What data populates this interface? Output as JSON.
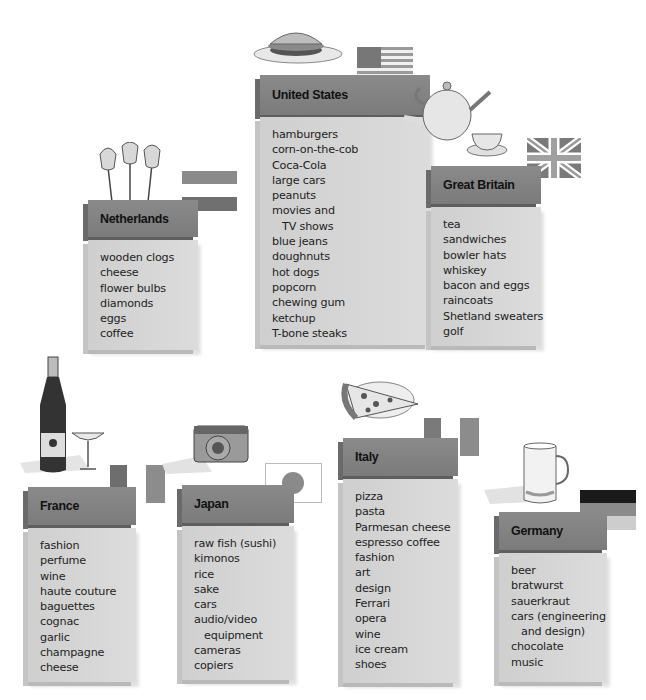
{
  "countries": [
    {
      "name": "United States",
      "items": [
        "hamburgers",
        "corn-on-the-cob",
        "Coca-Cola",
        "large cars",
        "peanuts",
        "movies and",
        "   TV shows",
        "blue jeans",
        "doughnuts",
        "hot dogs",
        "popcorn",
        "chewing gum",
        "ketchup",
        "T-bone steaks"
      ],
      "flag": "usa-flag",
      "illustration": "hamburger"
    },
    {
      "name": "Netherlands",
      "items": [
        "wooden clogs",
        "cheese",
        "flower bulbs",
        "diamonds",
        "eggs",
        "coffee"
      ],
      "flag": "netherlands-flag",
      "illustration": "tulips"
    },
    {
      "name": "Great Britain",
      "items": [
        "tea",
        "sandwiches",
        "bowler hats",
        "whiskey",
        "bacon and eggs",
        "raincoats",
        "Shetland sweaters",
        "golf"
      ],
      "flag": "union-jack-flag",
      "illustration": "teapot"
    },
    {
      "name": "France",
      "items": [
        "fashion",
        "perfume",
        "wine",
        "haute couture",
        "baguettes",
        "cognac",
        "garlic",
        "champagne",
        "cheese"
      ],
      "flag": "france-flag",
      "illustration": "champagne"
    },
    {
      "name": "Japan",
      "items": [
        "raw fish (sushi)",
        "kimonos",
        "rice",
        "sake",
        "cars",
        "audio/video",
        "   equipment",
        "cameras",
        "copiers"
      ],
      "flag": "japan-flag",
      "illustration": "camera"
    },
    {
      "name": "Italy",
      "items": [
        "pizza",
        "pasta",
        "Parmesan cheese",
        "espresso coffee",
        "fashion",
        "art",
        "design",
        "Ferrari",
        "opera",
        "wine",
        "ice cream",
        "shoes"
      ],
      "flag": "italy-flag",
      "illustration": "pizza"
    },
    {
      "name": "Germany",
      "items": [
        "beer",
        "bratwurst",
        "sauerkraut",
        "cars (engineering",
        "   and design)",
        "chocolate",
        "music"
      ],
      "flag": "germany-flag",
      "illustration": "beer-stein"
    }
  ]
}
